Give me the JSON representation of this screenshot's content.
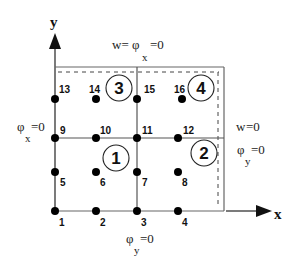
{
  "diagram": {
    "title": "",
    "axes": {
      "x_label": "x",
      "y_label": "y"
    },
    "nodes": [
      {
        "id": "1",
        "x": 55,
        "y": 211,
        "lx": 59,
        "ly": 226
      },
      {
        "id": "2",
        "x": 96,
        "y": 211,
        "lx": 100,
        "ly": 226
      },
      {
        "id": "3",
        "x": 137,
        "y": 211,
        "lx": 141,
        "ly": 226
      },
      {
        "id": "4",
        "x": 178,
        "y": 211,
        "lx": 182,
        "ly": 226
      },
      {
        "id": "5",
        "x": 55,
        "y": 172,
        "lx": 60,
        "ly": 186
      },
      {
        "id": "6",
        "x": 96,
        "y": 172,
        "lx": 100,
        "ly": 186
      },
      {
        "id": "7",
        "x": 137,
        "y": 172,
        "lx": 142,
        "ly": 186
      },
      {
        "id": "8",
        "x": 178,
        "y": 172,
        "lx": 182,
        "ly": 186
      },
      {
        "id": "9",
        "x": 55,
        "y": 138,
        "lx": 60,
        "ly": 134
      },
      {
        "id": "10",
        "x": 96,
        "y": 138,
        "lx": 100,
        "ly": 134
      },
      {
        "id": "11",
        "x": 137,
        "y": 138,
        "lx": 142,
        "ly": 134
      },
      {
        "id": "12",
        "x": 178,
        "y": 138,
        "lx": 183,
        "ly": 134
      },
      {
        "id": "13",
        "x": 55,
        "y": 99,
        "lx": 59,
        "ly": 93
      },
      {
        "id": "14",
        "x": 96,
        "y": 99,
        "lx": 89,
        "ly": 93
      },
      {
        "id": "15",
        "x": 137,
        "y": 99,
        "lx": 144,
        "ly": 93
      },
      {
        "id": "16",
        "x": 182,
        "y": 99,
        "lx": 174,
        "ly": 93
      }
    ],
    "elements": [
      {
        "id": "1",
        "cx": 116,
        "cy": 158,
        "r": 13
      },
      {
        "id": "2",
        "cx": 204,
        "cy": 153,
        "r": 13
      },
      {
        "id": "3",
        "cx": 119,
        "cy": 88,
        "r": 13
      },
      {
        "id": "4",
        "cx": 201,
        "cy": 88,
        "r": 13
      }
    ],
    "boundary_conditions": {
      "top": {
        "main": "w= φ",
        "sub": "x",
        "tail": "=0"
      },
      "left": {
        "main": "φ",
        "sub": "x",
        "tail": "=0"
      },
      "right_w": {
        "main": "w",
        "tail": " =0"
      },
      "right_phi": {
        "main": "φ",
        "sub": "y",
        "tail": "=0"
      },
      "bottom": {
        "main": "φ",
        "sub": "y",
        "tail": "=0"
      }
    },
    "colors": {
      "line": "#555555",
      "node": "#000000",
      "background": "#ffffff"
    }
  }
}
